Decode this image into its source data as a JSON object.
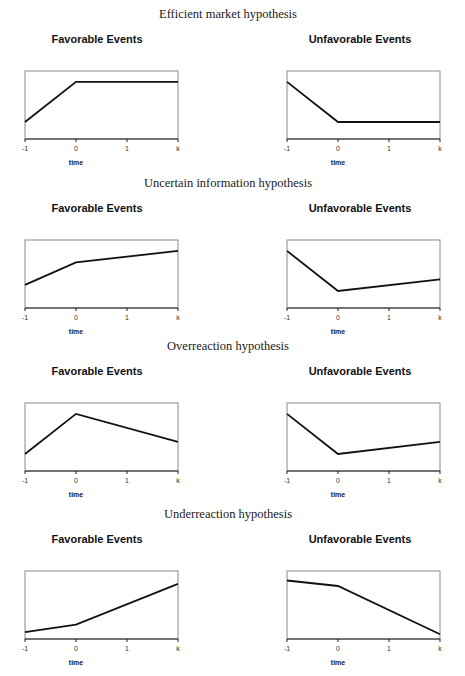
{
  "chart_data": [
    {
      "type": "line",
      "section_title": "Efficient market hypothesis",
      "panels": [
        {
          "title": "Favorable Events",
          "xlabel": "time",
          "xticks": [
            "-1",
            "0",
            "1",
            "k"
          ],
          "x": [
            -1,
            0,
            2
          ],
          "y": [
            0.25,
            0.84,
            0.84
          ],
          "ylim": [
            0,
            1
          ],
          "grid": false
        },
        {
          "title": "Unfavorable Events",
          "xlabel": "time",
          "xticks": [
            "-1",
            "0",
            "1",
            "k"
          ],
          "x": [
            -1,
            0,
            2
          ],
          "y": [
            0.84,
            0.25,
            0.25
          ],
          "ylim": [
            0,
            1
          ],
          "grid": false
        }
      ]
    },
    {
      "type": "line",
      "section_title": "Uncertain information hypothesis",
      "panels": [
        {
          "title": "Favorable Events",
          "xlabel": "time",
          "xticks": [
            "-1",
            "0",
            "1",
            "k"
          ],
          "x": [
            -1,
            0,
            2
          ],
          "y": [
            0.34,
            0.67,
            0.84
          ],
          "ylim": [
            0,
            1
          ],
          "grid": false
        },
        {
          "title": "Unfavorable Events",
          "xlabel": "time",
          "xticks": [
            "-1",
            "0",
            "1",
            "k"
          ],
          "x": [
            -1,
            0,
            2
          ],
          "y": [
            0.84,
            0.25,
            0.42
          ],
          "ylim": [
            0,
            1
          ],
          "grid": false
        }
      ]
    },
    {
      "type": "line",
      "section_title": "Overreaction hypothesis",
      "panels": [
        {
          "title": "Favorable Events",
          "xlabel": "time",
          "xticks": [
            "-1",
            "0",
            "1",
            "k"
          ],
          "x": [
            -1,
            0,
            2
          ],
          "y": [
            0.25,
            0.84,
            0.43
          ],
          "ylim": [
            0,
            1
          ],
          "grid": false
        },
        {
          "title": "Unfavorable Events",
          "xlabel": "time",
          "xticks": [
            "-1",
            "0",
            "1",
            "k"
          ],
          "x": [
            -1,
            0,
            2
          ],
          "y": [
            0.84,
            0.25,
            0.43
          ],
          "ylim": [
            0,
            1
          ],
          "grid": false
        }
      ]
    },
    {
      "type": "line",
      "section_title": "Underreaction hypothesis",
      "panels": [
        {
          "title": "Favorable Events",
          "xlabel": "time",
          "xticks": [
            "-1",
            "0",
            "1",
            "k"
          ],
          "x": [
            -1,
            0,
            2
          ],
          "y": [
            0.1,
            0.21,
            0.81
          ],
          "ylim": [
            0,
            1
          ],
          "grid": false
        },
        {
          "title": "Unfavorable Events",
          "xlabel": "time",
          "xticks": [
            "-1",
            "0",
            "1",
            "k"
          ],
          "x": [
            -1,
            0,
            2
          ],
          "y": [
            0.86,
            0.78,
            0.07
          ],
          "ylim": [
            0,
            1
          ],
          "grid": false
        }
      ]
    }
  ]
}
